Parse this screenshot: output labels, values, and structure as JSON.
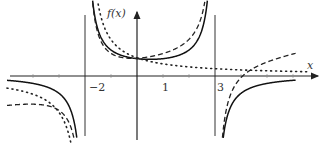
{
  "chart_data": {
    "type": "line",
    "title": "",
    "xlabel": "x",
    "ylabel": "f(x)",
    "xlim": [
      -5.2,
      6.8
    ],
    "ylim": [
      -3.0,
      2.9
    ],
    "grid": false,
    "legend": "none",
    "x_ticks": [
      {
        "value": -2,
        "label": "−2"
      },
      {
        "value": 1,
        "label": "1"
      },
      {
        "value": 3,
        "label": "3"
      }
    ],
    "vertical_asymptotes": [
      -2,
      3
    ],
    "series": [
      {
        "name": "solid",
        "style": "solid",
        "formula": "4/((x+2)*(3-x))"
      },
      {
        "name": "dashed",
        "style": "dashed",
        "formula": "4/((x+2)*(3-x)) + 0.12*x + 0.2 near asymptote-shared"
      },
      {
        "name": "dotted",
        "style": "dotted",
        "formula": "1.4/(x+2)"
      }
    ]
  }
}
